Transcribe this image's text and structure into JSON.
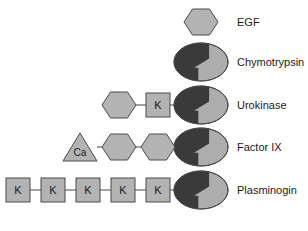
{
  "figure": {
    "type": "domain-architecture-diagram",
    "background_color": "#ffffff",
    "colors": {
      "light_gray_fill": "#b3b3b3",
      "dark_gray_fill": "#3a3a3a",
      "catalytic_light_fill": "#adadad",
      "outline": "#4a4a4a",
      "linker": "#707070",
      "text": "#1a1a1a"
    },
    "symbols": {
      "hexagon": "EGF-like domain",
      "square_k": "Kringle domain",
      "triangle_ca": "Calcium-binding Gla domain",
      "split_ellipse": "Serine protease catalytic domain"
    }
  },
  "rows": [
    {
      "id": "egf",
      "label": "EGF",
      "label_x": 237,
      "center_y": 22,
      "has_catalytic_ellipse": false,
      "modules": [
        {
          "kind": "hexagon",
          "cx": 201,
          "text": ""
        }
      ]
    },
    {
      "id": "chymotrypsin",
      "label": "Chymotrypsin",
      "label_x": 237,
      "center_y": 62,
      "has_catalytic_ellipse": true,
      "modules": []
    },
    {
      "id": "urokinase",
      "label": "Urokinase",
      "label_x": 237,
      "center_y": 105,
      "has_catalytic_ellipse": true,
      "modules": [
        {
          "kind": "hexagon",
          "cx": 119,
          "text": ""
        },
        {
          "kind": "square",
          "cx": 158,
          "text": "K"
        }
      ]
    },
    {
      "id": "factor-ix",
      "label": "Factor IX",
      "label_x": 237,
      "center_y": 147,
      "has_catalytic_ellipse": true,
      "modules": [
        {
          "kind": "triangle",
          "cx": 80,
          "text": "Ca"
        },
        {
          "kind": "hexagon",
          "cx": 119,
          "text": ""
        },
        {
          "kind": "hexagon",
          "cx": 158,
          "text": ""
        }
      ]
    },
    {
      "id": "plasminogin",
      "label": "Plasminogin",
      "label_x": 237,
      "center_y": 190,
      "has_catalytic_ellipse": true,
      "modules": [
        {
          "kind": "square",
          "cx": 18,
          "text": "K"
        },
        {
          "kind": "square",
          "cx": 53,
          "text": "K"
        },
        {
          "kind": "square",
          "cx": 88,
          "text": "K"
        },
        {
          "kind": "square",
          "cx": 123,
          "text": "K"
        },
        {
          "kind": "square",
          "cx": 158,
          "text": "K"
        }
      ]
    }
  ],
  "geometry": {
    "ellipse_cx": 201,
    "ellipse_rx": 27,
    "ellipse_ry": 19,
    "hexagon_rx": 17,
    "hexagon_ry": 13,
    "square_half": 12,
    "triangle_half_w": 17,
    "triangle_half_h": 14
  }
}
